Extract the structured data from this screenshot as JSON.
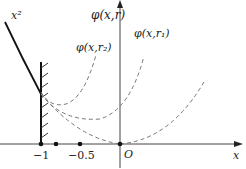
{
  "diagram": {
    "labels": {
      "curve_x2": "x²",
      "y_axis": "φ(x,r)",
      "curve_r2": "φ(x,r₂)",
      "curve_r1": "φ(x,r₁)",
      "origin": "O",
      "x_axis": "x",
      "tick_neg1": "−1",
      "tick_neg05": "−0.5"
    },
    "colors": {
      "axis": "#333333",
      "solid_curve": "#111111",
      "dashed_curve": "#777777",
      "text": "#222222"
    },
    "elements": {
      "x_axis_range": [
        -1,
        0.6
      ],
      "marked_points": [
        -1,
        -0.8,
        -0.5,
        0
      ],
      "wall_at_x": -1
    }
  }
}
